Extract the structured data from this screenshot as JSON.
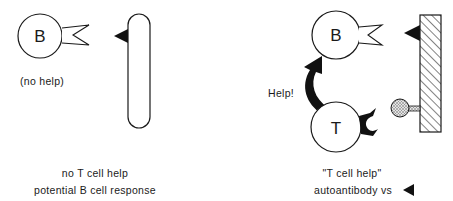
{
  "left_panel": {
    "b_cell_label": "B",
    "note": "(no help)",
    "caption_line1": "no T cell help",
    "caption_line2": "potential B cell response"
  },
  "right_panel": {
    "b_cell_label": "B",
    "t_cell_label": "T",
    "arrow_label": "Help!",
    "caption_line1": "\"T cell help\"",
    "caption_line2": "autoantibody vs"
  },
  "icons": {
    "antigen": "filled-triangle",
    "self_tissue_left": "rounded-pill",
    "self_tissue_right": "hatched-rectangle",
    "t_cell_antigen": "stippled-ball-on-stalk"
  },
  "colors": {
    "stroke": "#1a1a1a",
    "fill": "#ffffff",
    "stipple": "#bdbdbd"
  }
}
